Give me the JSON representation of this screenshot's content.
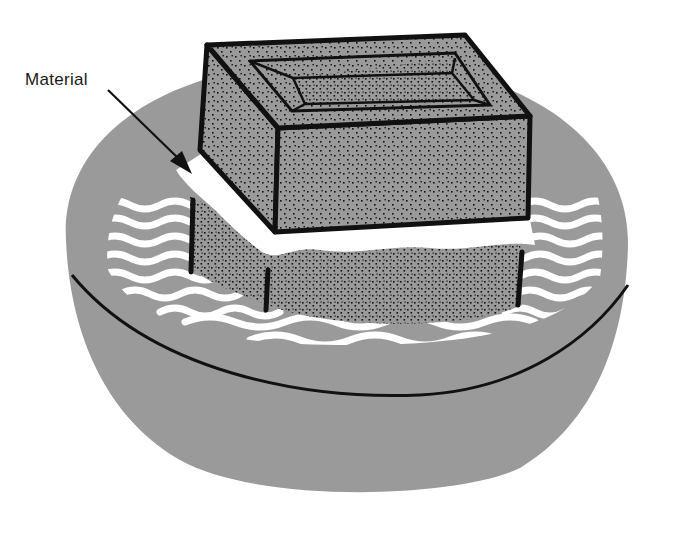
{
  "figure": {
    "labels": {
      "material": "Material"
    },
    "colors": {
      "basin_gray": "#9a9a9a",
      "outline": "#111111",
      "water_highlight": "#ffffff",
      "background": "#ffffff"
    }
  }
}
